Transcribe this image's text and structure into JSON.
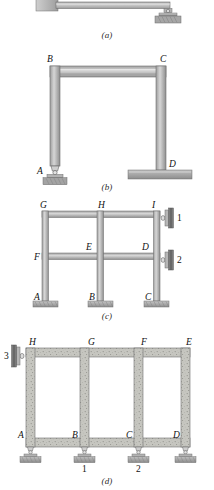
{
  "figure": {
    "panels": [
      {
        "caption": "(a)",
        "name": "cantilever-beam-with-roller",
        "description": "Horizontal beam fixed into a wall at the left end and supported by a rocker/pin bearing at the right end",
        "joint_labels": [],
        "support_labels": [],
        "supports": [
          "fixed-wall",
          "rocker-bearing"
        ]
      },
      {
        "caption": "(b)",
        "name": "portal-frame",
        "description": "Single-bay portal frame: pin support at A, fixed base at D",
        "joint_labels": [
          "B",
          "C",
          "A",
          "D"
        ],
        "support_labels": [],
        "supports": [
          "pin-rocker",
          "fixed-slab"
        ]
      },
      {
        "caption": "(c)",
        "name": "two-story-two-bay-frame",
        "description": "Two-story two-bay frame with fixed column bases and two roller supports bearing on a right-hand wall",
        "joint_labels": [
          "G",
          "H",
          "I",
          "F",
          "E",
          "D",
          "A",
          "B",
          "C"
        ],
        "support_labels": [
          "1",
          "2"
        ],
        "supports": [
          "fixed-base",
          "fixed-base",
          "fixed-base",
          "wall-roller",
          "wall-roller"
        ]
      },
      {
        "caption": "(d)",
        "name": "three-bay-concrete-frame",
        "description": "Three-bay reinforced-concrete frame on four pin supports with a roller bearing on a wall at the upper left",
        "joint_labels": [
          "H",
          "G",
          "F",
          "E",
          "A",
          "B",
          "C",
          "D"
        ],
        "support_labels": [
          "3",
          "1",
          "2"
        ],
        "supports": [
          "wall-roller",
          "pin",
          "pin",
          "pin",
          "pin"
        ]
      }
    ]
  },
  "colors": {
    "steel_face": "#b9b9b9",
    "steel_dark": "#8e8e8e",
    "steel_light": "#d2d2d2",
    "concrete": "#c3c3bd",
    "ground": "#a9a9a9",
    "outline": "#6f6f6f",
    "label": "#111111",
    "page": "#ffffff"
  },
  "captions": {
    "a": "(a)",
    "b": "(b)",
    "c": "(c)",
    "d": "(d)"
  },
  "labels": {
    "a_A": "",
    "b_A": "A",
    "b_B": "B",
    "b_C": "C",
    "b_D": "D",
    "c_A": "A",
    "c_B": "B",
    "c_C": "C",
    "c_D": "D",
    "c_E": "E",
    "c_F": "F",
    "c_G": "G",
    "c_H": "H",
    "c_I": "I",
    "c_s1": "1",
    "c_s2": "2",
    "d_A": "A",
    "d_B": "B",
    "d_C": "C",
    "d_D": "D",
    "d_E": "E",
    "d_F": "F",
    "d_G": "G",
    "d_H": "H",
    "d_s1": "1",
    "d_s2": "2",
    "d_s3": "3"
  }
}
